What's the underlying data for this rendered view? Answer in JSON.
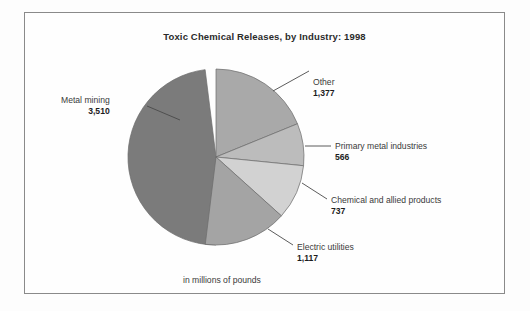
{
  "figure": {
    "title": "Toxic Chemical Releases, by Industry: 1998",
    "footnote": "in millions of pounds"
  },
  "chart_data": {
    "type": "pie",
    "title": "Toxic Chemical Releases, by Industry: 1998",
    "units_note": "in millions of pounds",
    "total": 7307,
    "categories": [
      "Metal mining",
      "Other",
      "Primary metal industries",
      "Chemical and allied products",
      "Electric utilities"
    ],
    "values": [
      3510,
      1377,
      566,
      737,
      1117
    ],
    "value_labels": [
      "3,510",
      "1,377",
      "566",
      "737",
      "1,117"
    ],
    "slices": [
      {
        "name": "Metal mining",
        "value": 3510,
        "value_label": "3,510",
        "color": "#7b7b7b",
        "start_angle": 180,
        "sweep": 172.9,
        "label_side": "left"
      },
      {
        "name": "Other",
        "value": 1377,
        "value_label": "1,377",
        "color": "#a9a9a9",
        "start_angle": 0,
        "sweep": 67.8,
        "label_side": "right"
      },
      {
        "name": "Primary metal industries",
        "value": 566,
        "value_label": "566",
        "color": "#bcbcbc",
        "start_angle": 67.8,
        "sweep": 27.9,
        "label_side": "right"
      },
      {
        "name": "Chemical and allied products",
        "value": 737,
        "value_label": "737",
        "color": "#d2d2d2",
        "start_angle": 95.7,
        "sweep": 36.3,
        "label_side": "right"
      },
      {
        "name": "Electric utilities",
        "value": 1117,
        "value_label": "1,117",
        "color": "#a4a4a4",
        "start_angle": 132.0,
        "sweep": 55.0,
        "label_side": "right"
      }
    ],
    "legend": "none",
    "grid": false,
    "border_color": "#8a8a8a",
    "outline_color": "#6b6b6b"
  }
}
